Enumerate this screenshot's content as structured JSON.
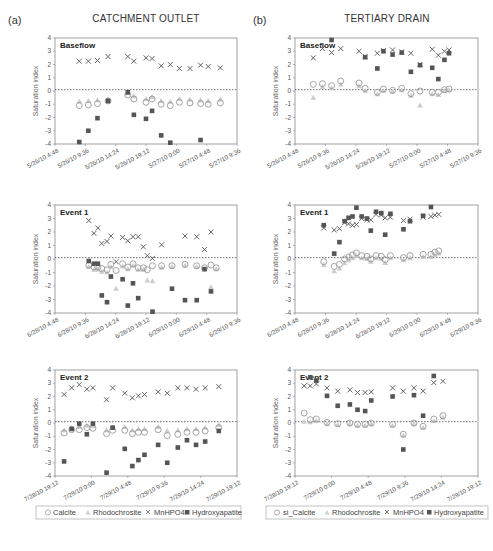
{
  "figure": {
    "columns": [
      {
        "letter": "(a)",
        "title": "CATCHMENT OUTLET"
      },
      {
        "letter": "(b)",
        "title": "TERTIARY DRAIN"
      }
    ],
    "ylabel": "Saturation index",
    "legends": [
      [
        "Calcite",
        "Rhodochrosite",
        "MnHPO4",
        "Hydroxyapatite"
      ],
      [
        "si_Calcite",
        "Rhodochrosite",
        "MnHPO4",
        "Hydroxyapatite"
      ]
    ],
    "colors": {
      "calcite": "#9a9a9a",
      "rhodochrosite": "#cccccc",
      "mnhpo4": "#555555",
      "hydroxyapatite": "#555555",
      "axis": "#8a8a8a",
      "zero_line": "#333333"
    }
  },
  "chart_data": [
    {
      "id": "a1",
      "type": "scatter",
      "title": "CATCHMENT OUTLET",
      "panel_label": "Baseflow",
      "ylabel": "Saturation index",
      "ylim": [
        -4,
        4
      ],
      "yticks": [
        4,
        3,
        2,
        1,
        0,
        -1,
        -2,
        -3,
        -4
      ],
      "xticks": [
        "5/26/10 4:48",
        "5/26/10 9:36",
        "5/26/10 14:24",
        "5/26/10 19:12",
        "5/27/10 0:00",
        "5/27/10 4:48",
        "5/27/10 9:36"
      ],
      "x": [
        0.8,
        1.1,
        1.4,
        1.75,
        2.4,
        2.6,
        3.0,
        3.2,
        3.5,
        3.8,
        4.1,
        4.45,
        4.8,
        5.05,
        5.45
      ],
      "series": [
        {
          "name": "Calcite",
          "values": [
            -1.1,
            -1.05,
            -0.95,
            -0.75,
            -0.3,
            -0.6,
            -0.85,
            -0.6,
            -1.0,
            -1.1,
            -0.85,
            -0.9,
            -0.95,
            -1.0,
            -0.9
          ]
        },
        {
          "name": "Rhodochrosite",
          "values": [
            -0.8,
            -0.75,
            -0.7,
            -0.6,
            -0.15,
            -0.4,
            -0.6,
            -0.45,
            -0.75,
            -0.8,
            -0.6,
            -0.65,
            -0.7,
            -0.75,
            -0.65
          ]
        },
        {
          "name": "MnHPO4",
          "values": [
            2.25,
            2.25,
            2.3,
            2.6,
            2.6,
            2.25,
            2.5,
            2.45,
            1.9,
            2.0,
            1.7,
            1.7,
            1.95,
            1.85,
            1.75
          ]
        },
        {
          "name": "Hydroxyapatite",
          "values": [
            -3.85,
            -3.0,
            -2.05,
            -0.75,
            -0.1,
            -1.8,
            -2.1,
            -1.5,
            -3.35,
            -3.9,
            null,
            null,
            -3.7,
            null,
            null
          ]
        }
      ]
    },
    {
      "id": "b1",
      "type": "scatter",
      "title": "TERTIARY DRAIN",
      "panel_label": "Baseflow",
      "ylabel": "Saturation index",
      "ylim": [
        -4,
        4
      ],
      "yticks": [
        4,
        3,
        2,
        1,
        0,
        -1,
        -2,
        -3,
        -4
      ],
      "xticks": [
        "5/26/10 4:48",
        "5/26/10 9:36",
        "5/26/10 14:24",
        "5/26/10 19:12",
        "5/27/10 0:00",
        "5/27/10 4:48",
        "5/27/10 9:36"
      ],
      "x": [
        0.6,
        0.9,
        1.2,
        1.5,
        2.1,
        2.3,
        2.7,
        2.9,
        3.2,
        3.5,
        3.8,
        4.1,
        4.5,
        4.7,
        4.9,
        5.05
      ],
      "series": [
        {
          "name": "si_Calcite",
          "values": [
            0.5,
            0.55,
            0.4,
            0.75,
            0.6,
            0.2,
            -0.1,
            0.15,
            0.05,
            0.2,
            -0.2,
            0.0,
            -0.1,
            -0.1,
            0.1,
            0.15
          ]
        },
        {
          "name": "Rhodochrosite",
          "values": [
            -0.5,
            0.3,
            0.2,
            0.5,
            0.35,
            0.0,
            -0.25,
            0.0,
            -0.05,
            0.05,
            -0.35,
            -1.1,
            -0.25,
            -0.3,
            0.0,
            0.05
          ]
        },
        {
          "name": "MnHPO4",
          "values": [
            2.5,
            3.2,
            2.9,
            3.2,
            3.0,
            2.6,
            2.85,
            3.05,
            3.1,
            2.95,
            2.85,
            2.0,
            3.15,
            2.7,
            3.0,
            3.1
          ]
        },
        {
          "name": "Hydroxyapatite",
          "values": [
            null,
            null,
            3.85,
            null,
            null,
            2.55,
            1.7,
            3.0,
            2.75,
            2.9,
            1.45,
            1.95,
            1.75,
            0.9,
            2.35,
            2.85
          ]
        }
      ]
    },
    {
      "id": "a2",
      "type": "scatter",
      "panel_label": "Event 1",
      "ylabel": "Saturation index",
      "ylim": [
        -4,
        4
      ],
      "yticks": [
        4,
        3,
        2,
        1,
        0,
        -1,
        -2,
        -3,
        -4
      ],
      "xticks": [
        "6/28/10 4:48",
        "6/28/10 9:36",
        "6/28/10 14:24",
        "6/28/10 19:12",
        "6/29/10 0:00",
        "6/29/10 4:48",
        "6/29/10 9:36"
      ],
      "x": [
        1.3,
        1.5,
        1.65,
        1.8,
        2.0,
        2.15,
        2.35,
        2.6,
        2.8,
        3.0,
        3.2,
        3.4,
        3.55,
        3.75,
        3.95,
        4.1,
        4.5,
        5.0,
        5.45,
        5.75,
        6.0,
        6.2
      ],
      "series": [
        {
          "name": "Calcite",
          "values": [
            -0.45,
            -0.6,
            -0.6,
            -0.7,
            -0.8,
            -0.4,
            -0.85,
            -0.35,
            -0.6,
            -0.35,
            -0.65,
            -0.65,
            -0.8,
            -0.5,
            null,
            -0.5,
            -0.5,
            -0.4,
            -0.5,
            -0.65,
            -0.45,
            -0.65
          ]
        },
        {
          "name": "Rhodochrosite",
          "values": [
            -0.6,
            -0.8,
            -0.8,
            -0.95,
            -1.0,
            -0.6,
            -2.2,
            -0.55,
            -0.75,
            -0.5,
            -0.8,
            -0.8,
            -1.6,
            -1.65,
            null,
            -0.65,
            -0.6,
            -0.5,
            -0.6,
            -0.75,
            -2.1,
            -0.75
          ]
        },
        {
          "name": "MnHPO4",
          "values": [
            2.85,
            1.9,
            2.3,
            1.15,
            1.3,
            1.7,
            -0.2,
            1.6,
            1.35,
            1.65,
            1.65,
            0.9,
            0.25,
            0.05,
            null,
            1.05,
            null,
            1.7,
            1.65,
            0.7,
            2.0,
            null
          ]
        },
        {
          "name": "Hydroxyapatite",
          "values": [
            -0.15,
            -0.35,
            -0.35,
            -2.7,
            -3.2,
            -1.3,
            null,
            -1.5,
            -3.45,
            -1.8,
            -2.9,
            null,
            null,
            -3.9,
            null,
            null,
            -2.2,
            -3.05,
            -3.05,
            -0.75,
            -2.4,
            null
          ]
        }
      ]
    },
    {
      "id": "b2",
      "type": "scatter",
      "panel_label": "Event 1",
      "ylabel": "Saturation index",
      "ylim": [
        -4,
        4
      ],
      "yticks": [
        4,
        3,
        2,
        1,
        0,
        -1,
        -2,
        -3,
        -4
      ],
      "xticks": [
        "6/28/10 4:48",
        "6/28/10 9:36",
        "6/28/10 14:24",
        "6/28/10 19:12",
        "6/29/10 0:00",
        "6/29/10 4:48",
        "6/29/10 9:36"
      ],
      "x": [
        1.1,
        1.5,
        1.7,
        1.9,
        2.05,
        2.2,
        2.35,
        2.55,
        2.75,
        2.9,
        3.1,
        3.3,
        3.45,
        3.65,
        3.8,
        4.15,
        4.4,
        4.9,
        5.2,
        5.35,
        5.5
      ],
      "series": [
        {
          "name": "si_Calcite",
          "values": [
            -0.2,
            -0.55,
            -0.4,
            0.0,
            0.15,
            0.3,
            0.45,
            0.25,
            0.2,
            0.0,
            0.25,
            0.2,
            -0.05,
            0.25,
            null,
            0.1,
            0.25,
            0.35,
            0.35,
            0.5,
            0.6
          ]
        },
        {
          "name": "Rhodochrosite",
          "values": [
            -0.45,
            -0.9,
            -0.7,
            -0.3,
            -0.1,
            0.05,
            0.2,
            0.05,
            0.0,
            -0.2,
            0.05,
            0.0,
            -0.3,
            0.05,
            null,
            -0.1,
            0.05,
            0.15,
            0.15,
            0.3,
            0.4
          ]
        },
        {
          "name": "MnHPO4",
          "values": [
            2.3,
            2.15,
            2.25,
            2.7,
            2.6,
            2.5,
            2.55,
            3.0,
            2.9,
            2.9,
            3.3,
            3.25,
            3.05,
            3.1,
            null,
            2.85,
            2.95,
            3.1,
            3.15,
            3.25,
            3.3
          ]
        },
        {
          "name": "Hydroxyapatite",
          "values": [
            2.5,
            0.4,
            1.25,
            2.8,
            3.05,
            3.15,
            3.8,
            3.15,
            3.0,
            2.1,
            3.5,
            3.4,
            1.8,
            3.35,
            null,
            2.2,
            2.8,
            3.2,
            3.85,
            null,
            null
          ]
        }
      ]
    },
    {
      "id": "a3",
      "type": "scatter",
      "panel_label": "Event 2",
      "ylabel": "Saturation index",
      "ylim": [
        -4,
        4
      ],
      "yticks": [
        4,
        3,
        2,
        1,
        0,
        -1,
        -2,
        -3,
        -4
      ],
      "xticks": [
        "7/28/10 19:12",
        "7/29/10 0:00",
        "7/29/10 4:48",
        "7/29/10 9:36",
        "7/29/10 14:24",
        "7/29/10 19:12"
      ],
      "x": [
        0.3,
        0.55,
        0.8,
        1.05,
        1.25,
        1.7,
        1.9,
        2.3,
        2.55,
        2.75,
        2.95,
        3.4,
        3.7,
        4.05,
        4.35,
        4.65,
        4.95,
        5.4
      ],
      "series": [
        {
          "name": "Calcite",
          "values": [
            -0.75,
            -0.5,
            -0.5,
            -0.35,
            -0.4,
            -0.8,
            -0.55,
            -0.55,
            -0.8,
            -0.7,
            -0.7,
            -0.5,
            -0.95,
            -0.85,
            -0.7,
            -0.7,
            -0.6,
            -0.35
          ]
        },
        {
          "name": "Rhodochrosite",
          "values": [
            -0.55,
            -0.35,
            -0.3,
            -0.2,
            -0.25,
            -0.55,
            -0.35,
            -0.3,
            -0.55,
            -0.45,
            -0.45,
            -0.3,
            -0.6,
            -0.55,
            -0.45,
            -0.45,
            -0.35,
            -0.15
          ]
        },
        {
          "name": "MnHPO4",
          "values": [
            2.15,
            2.65,
            2.9,
            2.55,
            2.65,
            1.75,
            2.65,
            2.25,
            1.9,
            2.05,
            2.15,
            2.35,
            2.25,
            2.65,
            2.65,
            2.55,
            2.65,
            2.75
          ]
        },
        {
          "name": "Hydroxyapatite",
          "values": [
            -2.9,
            -0.45,
            -0.05,
            -0.85,
            -0.05,
            -3.75,
            -0.35,
            -1.95,
            -3.25,
            -2.8,
            -2.4,
            -1.65,
            -3.0,
            -1.85,
            -1.3,
            -1.65,
            -1.4,
            -0.6
          ]
        }
      ]
    },
    {
      "id": "b3",
      "type": "scatter",
      "panel_label": "Event 2",
      "ylabel": "Saturation index",
      "ylim": [
        -4,
        4
      ],
      "yticks": [
        4,
        3,
        2,
        1,
        0,
        -1,
        -2,
        -3,
        -4
      ],
      "xticks": [
        "7/28/10 19:12",
        "7/29/10 0:00",
        "7/29/10 4:48",
        "7/29/10 9:36",
        "7/29/10 14:24",
        "7/29/10 19:12"
      ],
      "x": [
        0.3,
        0.5,
        0.7,
        1.05,
        1.4,
        1.8,
        2.05,
        2.3,
        2.5,
        3.2,
        3.55,
        3.9,
        4.2,
        4.55,
        4.85
      ],
      "series": [
        {
          "name": "si_Calcite",
          "values": [
            0.75,
            0.25,
            0.3,
            0.05,
            -0.05,
            0.0,
            -0.1,
            -0.1,
            0.0,
            -0.1,
            -0.85,
            0.0,
            -0.25,
            0.3,
            0.55
          ]
        },
        {
          "name": "Rhodochrosite",
          "values": [
            0.1,
            0.05,
            0.15,
            -0.1,
            -0.15,
            -0.1,
            -0.2,
            -0.2,
            -0.1,
            -0.2,
            -0.95,
            -0.1,
            -0.35,
            0.15,
            0.4
          ]
        },
        {
          "name": "MnHPO4",
          "values": [
            2.8,
            2.8,
            2.95,
            2.65,
            2.4,
            2.5,
            2.3,
            2.3,
            2.35,
            2.65,
            2.4,
            2.65,
            2.4,
            3.05,
            3.15
          ]
        },
        {
          "name": "Hydroxyapatite",
          "values": [
            null,
            3.45,
            3.2,
            2.05,
            1.3,
            1.4,
            1.0,
            0.9,
            1.7,
            2.0,
            -2.0,
            2.1,
            0.55,
            3.55,
            null
          ]
        }
      ]
    }
  ]
}
